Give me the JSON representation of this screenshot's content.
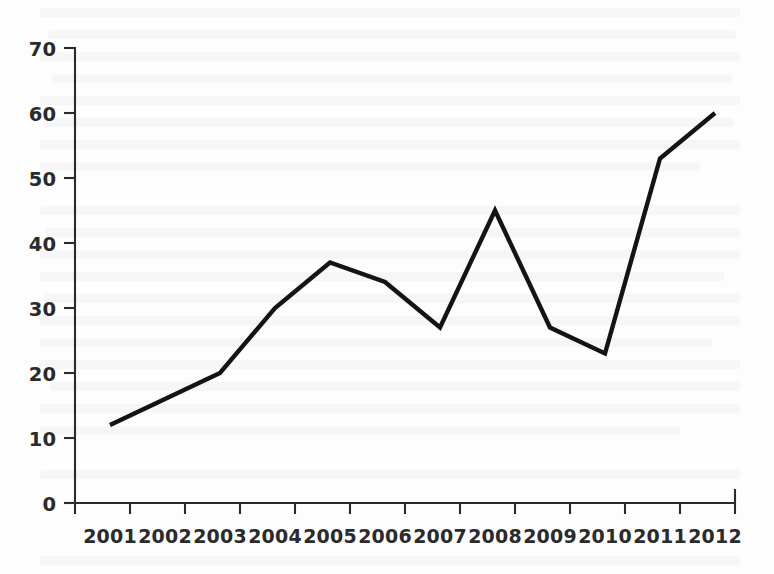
{
  "chart_data": {
    "type": "line",
    "title": "",
    "subtitle": "",
    "xlabel": "",
    "ylabel": "",
    "categories": [
      "2001",
      "2002",
      "2003",
      "2004",
      "2005",
      "2006",
      "2007",
      "2008",
      "2009",
      "2010",
      "2011",
      "2012"
    ],
    "values": [
      12,
      16,
      20,
      30,
      37,
      34,
      27,
      45,
      27,
      23,
      53,
      60
    ],
    "series": [
      {
        "name": "series-1",
        "values": [
          12,
          16,
          20,
          30,
          37,
          34,
          27,
          45,
          27,
          23,
          53,
          60
        ]
      }
    ],
    "ylim": [
      0,
      70
    ],
    "y_ticks": [
      0,
      10,
      20,
      30,
      40,
      50,
      60,
      70
    ],
    "y_tick_labels": [
      "0",
      "10",
      "20",
      "30",
      "40",
      "50",
      "60",
      "70"
    ],
    "x_tick_labels": [
      "2001",
      "2002",
      "2003",
      "2004",
      "2005",
      "2006",
      "2007",
      "2008",
      "2009",
      "2010",
      "2011",
      "2012"
    ],
    "grid": false,
    "legend": false,
    "legend_position": "none",
    "line_color": "#141414",
    "axis_color": "#2b2b2b",
    "background_color": "#fdfdfd",
    "markers": false
  }
}
